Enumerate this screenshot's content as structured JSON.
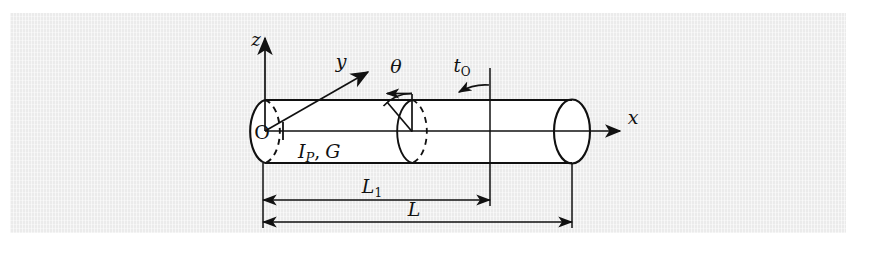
{
  "figure": {
    "kind": "engineering-diagram",
    "background_color": "#ebebeb",
    "page_color": "#ffffff",
    "line_color": "#111111",
    "labels": {
      "axis_z": "z",
      "axis_y": "y",
      "axis_x": "x",
      "origin": "O",
      "angle": "θ",
      "torque": "t",
      "torque_sub": "O",
      "properties_polar_moment": "I",
      "properties_polar_moment_sub": "P",
      "properties_separator": ",",
      "properties_shear_modulus": "G",
      "dim_partial": "L",
      "dim_partial_sub": "1",
      "dim_total": "L"
    },
    "geometry": {
      "cylinder_top_y": 100,
      "cylinder_axis_y": 130,
      "cylinder_bottom_y": 163,
      "left_cap_center_x": 265,
      "right_cap_center_x": 572,
      "cap_rx": 18,
      "cap_ry": 32,
      "mid_disk_center_x": 412,
      "torque_station_x": 490,
      "dim_l1_y": 200,
      "dim_l_y": 222
    }
  }
}
